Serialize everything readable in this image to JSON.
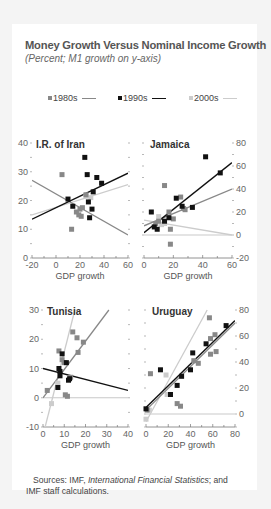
{
  "title": "Money Growth Versus Nominal Income Growth",
  "subtitle": "(Percent; M1 growth on y-axis)",
  "legend": [
    {
      "label": "1980s",
      "color": "#888888"
    },
    {
      "label": "1990s",
      "color": "#111111"
    },
    {
      "label": "2000s",
      "color": "#cccccc"
    }
  ],
  "source": {
    "prefix": "Sources: IMF, ",
    "italic": "International Financial Statistics",
    "suffix": "; and IMF staff calculations."
  },
  "chart_data": [
    {
      "type": "scatter",
      "title": "I.R. of Iran",
      "xlabel": "GDP growth",
      "ylabel": "M1 growth",
      "xlim": [
        -20,
        60
      ],
      "ylim": [
        0,
        40
      ],
      "xticks": [
        -20,
        0,
        20,
        40,
        60
      ],
      "yticks": [
        0,
        10,
        20,
        30,
        40
      ],
      "yaxis_side": "left",
      "series": [
        {
          "name": "1980s",
          "points": [
            [
              5,
              29
            ],
            [
              13,
              10
            ],
            [
              17,
              16
            ],
            [
              19,
              15
            ],
            [
              20,
              17
            ],
            [
              21,
              14.5
            ],
            [
              22,
              17.5
            ],
            [
              25,
              22
            ]
          ],
          "fit": [
            [
              -20,
              27
            ],
            [
              60,
              8
            ]
          ]
        },
        {
          "name": "1990s",
          "points": [
            [
              10,
              20.5
            ],
            [
              14,
              18
            ],
            [
              24,
              35
            ],
            [
              26,
              29
            ],
            [
              27,
              19.5
            ],
            [
              28,
              14
            ],
            [
              30,
              17
            ],
            [
              31,
              23
            ],
            [
              34,
              28
            ],
            [
              38,
              26
            ]
          ],
          "fit": [
            [
              -20,
              13.5
            ],
            [
              60,
              29.5
            ]
          ]
        },
        {
          "name": "2000s",
          "points": [
            [
              25,
              21.5
            ],
            [
              29,
              21
            ]
          ],
          "fit": [
            [
              -20,
              15
            ],
            [
              60,
              25.5
            ]
          ]
        }
      ]
    },
    {
      "type": "scatter",
      "title": "Jamaica",
      "xlabel": "GDP growth",
      "ylabel": "M1 growth",
      "xlim": [
        0,
        60
      ],
      "ylim": [
        -20,
        80
      ],
      "xticks": [
        0,
        20,
        40,
        60
      ],
      "yticks": [
        -20,
        0,
        20,
        40,
        60,
        80
      ],
      "yaxis_side": "right",
      "series": [
        {
          "name": "1980s",
          "points": [
            [
              8,
              10
            ],
            [
              10,
              12
            ],
            [
              14,
              43
            ],
            [
              17,
              20
            ],
            [
              18,
              5
            ],
            [
              20,
              14
            ],
            [
              25,
              33
            ],
            [
              27,
              23
            ],
            [
              28,
              22
            ],
            [
              18,
              -8
            ]
          ],
          "fit": [
            [
              0,
              8
            ],
            [
              60,
              40
            ]
          ]
        },
        {
          "name": "1990s",
          "points": [
            [
              5,
              20
            ],
            [
              7,
              7
            ],
            [
              9,
              5
            ],
            [
              14,
              12
            ],
            [
              17,
              15
            ],
            [
              22,
              32
            ],
            [
              26,
              25
            ],
            [
              33,
              24
            ],
            [
              42,
              68
            ],
            [
              52,
              54
            ]
          ],
          "fit": [
            [
              0,
              2
            ],
            [
              60,
              63
            ]
          ]
        },
        {
          "name": "2000s",
          "points": [
            [
              10,
              16
            ],
            [
              12,
              9
            ],
            [
              14,
              10
            ]
          ],
          "fit": [
            [
              0,
              13
            ],
            [
              60,
              0
            ]
          ]
        }
      ]
    },
    {
      "type": "scatter",
      "title": "Tunisia",
      "xlabel": "GDP growth",
      "ylabel": "M1 growth",
      "xlim": [
        0,
        40
      ],
      "ylim": [
        -10,
        30
      ],
      "xticks": [
        0,
        10,
        20,
        30,
        40
      ],
      "yticks": [
        -10,
        0,
        10,
        20,
        30
      ],
      "yaxis_side": "left",
      "series": [
        {
          "name": "1980s",
          "points": [
            [
              2,
              2.5
            ],
            [
              7.5,
              16
            ],
            [
              9,
              13
            ],
            [
              10,
              12
            ],
            [
              13,
              7
            ],
            [
              14,
              22.5
            ],
            [
              16,
              20.5
            ],
            [
              16.5,
              15.5
            ],
            [
              19,
              19
            ],
            [
              10.5,
              1
            ],
            [
              11.5,
              0.5
            ]
          ],
          "fit": [
            [
              0,
              0
            ],
            [
              31,
              30
            ]
          ]
        },
        {
          "name": "1990s",
          "points": [
            [
              7,
              3.5
            ],
            [
              7.5,
              10
            ],
            [
              8,
              7.5
            ],
            [
              8,
              9
            ],
            [
              9,
              15
            ],
            [
              11,
              12
            ],
            [
              12,
              6
            ],
            [
              12.5,
              6.5
            ]
          ],
          "fit": [
            [
              0,
              10
            ],
            [
              40,
              2.5
            ]
          ]
        },
        {
          "name": "2000s",
          "points": [
            [
              4,
              -2
            ],
            [
              7,
              5
            ]
          ],
          "fit": [
            [
              1,
              -10
            ],
            [
              15,
              30
            ]
          ]
        }
      ]
    },
    {
      "type": "scatter",
      "title": "Uruguay",
      "xlabel": "GDP growth",
      "ylabel": "M1 growth",
      "xlim": [
        0,
        80
      ],
      "ylim": [
        -10,
        80
      ],
      "xticks": [
        0,
        20,
        40,
        60,
        80
      ],
      "yticks": [
        0,
        20,
        40,
        60,
        80
      ],
      "yaxis_side": "right",
      "series": [
        {
          "name": "1980s",
          "points": [
            [
              4,
              31
            ],
            [
              28,
              8
            ],
            [
              31,
              6
            ],
            [
              43,
              41
            ],
            [
              47,
              39
            ],
            [
              57,
              74
            ],
            [
              58,
              58
            ],
            [
              58,
              46
            ],
            [
              62,
              61
            ],
            [
              63,
              48
            ],
            [
              1,
              3
            ]
          ],
          "fit": [
            [
              0,
              3
            ],
            [
              80,
              70
            ]
          ]
        },
        {
          "name": "1990s",
          "points": [
            [
              0,
              4
            ],
            [
              13,
              34
            ],
            [
              22,
              15
            ],
            [
              28,
              22
            ],
            [
              32,
              29
            ],
            [
              40,
              34
            ],
            [
              42,
              47
            ],
            [
              54,
              54
            ],
            [
              72,
              68
            ]
          ],
          "fit": [
            [
              0,
              5
            ],
            [
              80,
              72
            ]
          ]
        },
        {
          "name": "2000s",
          "points": [
            [
              0,
              -4
            ],
            [
              3,
              3
            ],
            [
              18,
              30
            ],
            [
              19,
              15
            ]
          ],
          "fit": [
            [
              0,
              -6
            ],
            [
              55,
              80
            ]
          ]
        }
      ]
    }
  ]
}
